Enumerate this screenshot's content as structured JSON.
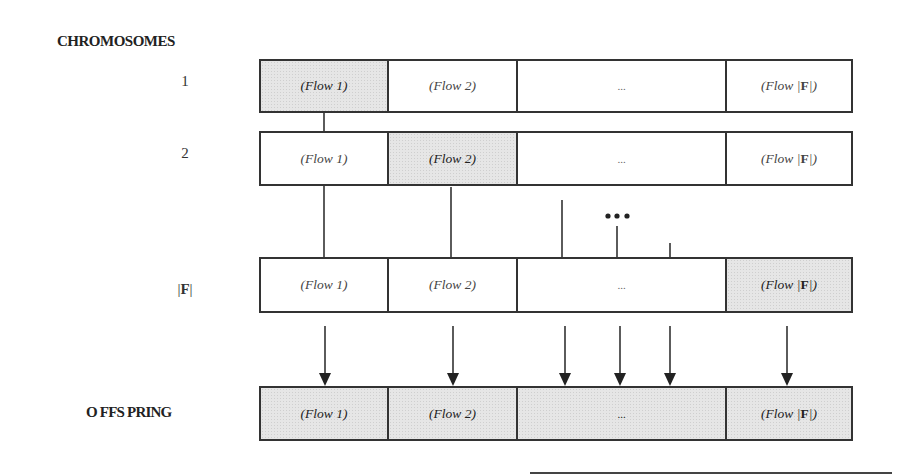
{
  "headings": {
    "chromosomes": "CHROMOSOMES",
    "offspring": "O FFS PRING"
  },
  "row_labels": {
    "row1": "1",
    "row2": "2",
    "rowF_prefix": "|",
    "rowF_bold": "F",
    "rowF_suffix": "|"
  },
  "cells": {
    "flow1": "(Flow 1)",
    "flow2": "(Flow 2)",
    "ellipsis": "...",
    "flowF_prefix": "(Flow |",
    "flowF_bold": "F",
    "flowF_suffix": "|)"
  },
  "rows": [
    {
      "label": "1",
      "shaded_cell": 1
    },
    {
      "label": "2",
      "shaded_cell": 2
    },
    {
      "label": "|F|",
      "shaded_cell": 4
    },
    {
      "label": "OFFSPRING",
      "shaded_cell": "all"
    }
  ],
  "ellipsis_dots": "•••",
  "colors": {
    "shade": "#e6e6e6",
    "line": "#333333"
  }
}
